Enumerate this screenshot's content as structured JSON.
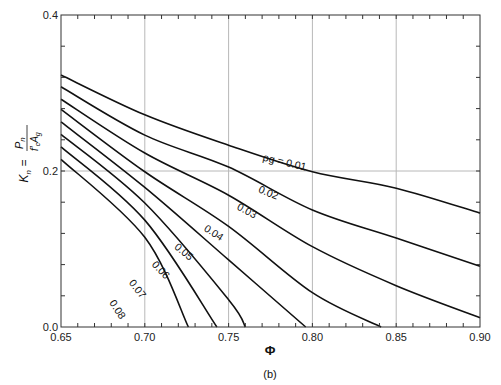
{
  "chart_data": {
    "type": "line",
    "title": "",
    "caption": "(b)",
    "xlabel": "Φ",
    "ylabel": "K_n = P_n / (f'_c A_g)",
    "xlim": [
      0.65,
      0.9
    ],
    "ylim": [
      0.0,
      0.4
    ],
    "x_ticks": [
      "0.65",
      "0.70",
      "0.75",
      "0.80",
      "0.85",
      "0.90"
    ],
    "y_ticks": [
      "0.0",
      "0.2",
      "0.4"
    ],
    "grid": {
      "x_lines": [
        0.7,
        0.75,
        0.8,
        0.85
      ],
      "y_lines": [
        0.2
      ]
    },
    "legend": "inline curve labels",
    "series": [
      {
        "name": "ρg = 0.01",
        "label": "ρg = 0.01",
        "points": [
          [
            0.65,
            0.323
          ],
          [
            0.7,
            0.272
          ],
          [
            0.75,
            0.233
          ],
          [
            0.8,
            0.199
          ],
          [
            0.85,
            0.178
          ],
          [
            0.9,
            0.146
          ]
        ]
      },
      {
        "name": "0.02",
        "label": "0.02",
        "points": [
          [
            0.65,
            0.308
          ],
          [
            0.7,
            0.246
          ],
          [
            0.75,
            0.205
          ],
          [
            0.8,
            0.15
          ],
          [
            0.85,
            0.114
          ],
          [
            0.9,
            0.078
          ]
        ]
      },
      {
        "name": "0.03",
        "label": "0.03",
        "points": [
          [
            0.65,
            0.292
          ],
          [
            0.7,
            0.223
          ],
          [
            0.75,
            0.169
          ],
          [
            0.8,
            0.103
          ],
          [
            0.85,
            0.053
          ],
          [
            0.9,
            0.012
          ]
        ]
      },
      {
        "name": "0.04",
        "label": "0.04",
        "points": [
          [
            0.65,
            0.279
          ],
          [
            0.7,
            0.199
          ],
          [
            0.75,
            0.129
          ],
          [
            0.8,
            0.044
          ],
          [
            0.841,
            0.0
          ]
        ]
      },
      {
        "name": "0.05",
        "label": "0.05",
        "points": [
          [
            0.65,
            0.263
          ],
          [
            0.7,
            0.179
          ],
          [
            0.75,
            0.086
          ],
          [
            0.796,
            0.0
          ]
        ]
      },
      {
        "name": "0.06",
        "label": "0.06",
        "points": [
          [
            0.65,
            0.247
          ],
          [
            0.7,
            0.159
          ],
          [
            0.75,
            0.035
          ],
          [
            0.76,
            0.0
          ]
        ]
      },
      {
        "name": "0.07",
        "label": "0.07",
        "points": [
          [
            0.65,
            0.231
          ],
          [
            0.7,
            0.137
          ],
          [
            0.743,
            0.0
          ]
        ]
      },
      {
        "name": "0.08",
        "label": "0.08",
        "points": [
          [
            0.65,
            0.215
          ],
          [
            0.7,
            0.115
          ],
          [
            0.726,
            0.0
          ]
        ]
      }
    ],
    "curve_label_positions": [
      {
        "text": "ρg = 0.01",
        "x": 0.783,
        "y": 0.207,
        "angle": 13
      },
      {
        "text": "0.02",
        "x": 0.773,
        "y": 0.168,
        "angle": 22
      },
      {
        "text": "0.03",
        "x": 0.76,
        "y": 0.145,
        "angle": 28
      },
      {
        "text": "0.04",
        "x": 0.74,
        "y": 0.117,
        "angle": 33
      },
      {
        "text": "0.05",
        "x": 0.722,
        "y": 0.093,
        "angle": 40
      },
      {
        "text": "0.06",
        "x": 0.708,
        "y": 0.07,
        "angle": 47
      },
      {
        "text": "0.07",
        "x": 0.694,
        "y": 0.046,
        "angle": 52
      },
      {
        "text": "0.08",
        "x": 0.682,
        "y": 0.02,
        "angle": 57
      }
    ]
  },
  "colors": {
    "curve": "#111111",
    "grid": "#b8b8b8",
    "axis": "#333333"
  }
}
